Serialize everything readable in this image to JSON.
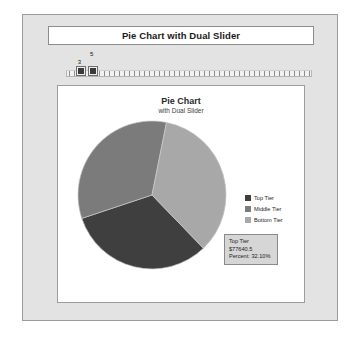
{
  "window": {
    "header_title": "Pie Chart with Dual Slider"
  },
  "slider": {
    "name": "dual-slider",
    "low_value": "3",
    "high_value": "5",
    "min": 0,
    "max": 50,
    "low_position_pct": 6,
    "high_position_pct": 11
  },
  "legend": {
    "position": "right",
    "items": [
      {
        "label": "Top Tier",
        "color": "#3f3f3f"
      },
      {
        "label": "Middle Tier",
        "color": "#7b7b7b"
      },
      {
        "label": "Bottom Tier",
        "color": "#a8a8a8"
      }
    ]
  },
  "tooltip": {
    "series": "Top Tier",
    "value": "$77640.5",
    "percent": "Percent: 32.10%"
  },
  "chart_data": {
    "type": "pie",
    "title": "Pie Chart",
    "subtitle": "with Dual Slider",
    "xlabel": "",
    "ylabel": "",
    "legend_position": "right",
    "grid": false,
    "categories": [
      "Top Tier",
      "Middle Tier",
      "Bottom Tier"
    ],
    "values": [
      77640.5,
      80460.0,
      83760.0
    ],
    "percents": [
      32.1,
      33.26,
      34.64
    ],
    "colors": [
      "#3f3f3f",
      "#7b7b7b",
      "#a8a8a8"
    ],
    "start_angle_deg": 46,
    "slices": [
      {
        "name": "Top Tier",
        "value": 77640.5,
        "percent": 32.1,
        "color": "#3f3f3f"
      },
      {
        "name": "Middle Tier",
        "value": 80460.0,
        "percent": 33.26,
        "color": "#7b7b7b"
      },
      {
        "name": "Bottom Tier",
        "value": 83760.0,
        "percent": 34.64,
        "color": "#a8a8a8"
      }
    ]
  }
}
